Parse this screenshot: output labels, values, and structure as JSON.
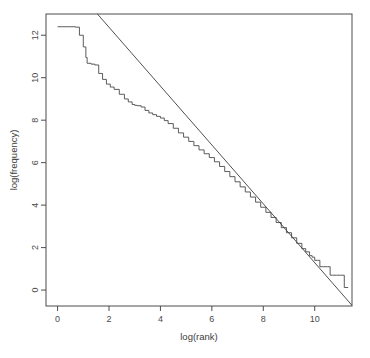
{
  "figure": {
    "background_color": "#ffffff",
    "frame_color": "#4d4d4d",
    "data_color": "#4a4a4a",
    "fit_color": "#3c3c3c",
    "plot_box": {
      "left": 46,
      "top": 14,
      "right": 352,
      "bottom": 306
    }
  },
  "chart_data": {
    "type": "line",
    "title": "",
    "subtitle": "",
    "xlabel": "log(rank)",
    "ylabel": "log(frequency)",
    "xlim": [
      -0.45,
      11.45
    ],
    "ylim": [
      -0.75,
      13.0
    ],
    "xticks": [
      0,
      2,
      4,
      6,
      8,
      10
    ],
    "yticks": [
      0,
      2,
      4,
      6,
      8,
      10,
      12
    ],
    "xtick_labels": [
      "0",
      "2",
      "4",
      "6",
      "8",
      "10"
    ],
    "ytick_labels": [
      "0",
      "2",
      "4",
      "6",
      "8",
      "10",
      "12"
    ],
    "grid": false,
    "legend": null,
    "legend_position": "none",
    "series": [
      {
        "name": "empirical",
        "style": "step",
        "description": "observed log frequency versus log rank (Zipf curve)",
        "x": [
          0.0,
          0.2,
          0.4,
          0.6,
          0.69,
          0.85,
          1.0,
          1.1,
          1.15,
          1.3,
          1.45,
          1.6,
          1.75,
          1.9,
          2.05,
          2.2,
          2.4,
          2.6,
          2.75,
          2.9,
          3.0,
          3.1,
          3.25,
          3.4,
          3.55,
          3.7,
          3.85,
          4.0,
          4.15,
          4.3,
          4.5,
          4.7,
          4.9,
          5.1,
          5.3,
          5.5,
          5.7,
          5.9,
          6.1,
          6.3,
          6.5,
          6.7,
          6.9,
          7.1,
          7.3,
          7.5,
          7.7,
          7.9,
          8.1,
          8.3,
          8.5,
          8.7,
          8.9,
          9.1,
          9.3,
          9.5,
          9.65,
          9.8,
          9.9,
          10.0,
          10.1,
          10.2,
          10.35,
          10.5,
          10.6,
          10.7,
          10.85,
          11.0,
          11.15,
          11.3
        ],
        "y": [
          12.4,
          12.4,
          12.4,
          12.4,
          12.38,
          12.0,
          11.45,
          10.95,
          10.68,
          10.64,
          10.6,
          10.2,
          9.92,
          9.7,
          9.56,
          9.45,
          9.22,
          9.0,
          8.86,
          8.74,
          8.7,
          8.68,
          8.62,
          8.46,
          8.34,
          8.26,
          8.18,
          8.1,
          7.98,
          7.84,
          7.62,
          7.4,
          7.2,
          7.0,
          6.8,
          6.6,
          6.42,
          6.24,
          6.04,
          5.82,
          5.58,
          5.34,
          5.1,
          4.86,
          4.62,
          4.38,
          4.14,
          3.9,
          3.66,
          3.42,
          3.18,
          2.94,
          2.7,
          2.46,
          2.2,
          1.95,
          1.8,
          1.62,
          1.55,
          1.4,
          1.4,
          1.1,
          1.1,
          1.1,
          0.7,
          0.7,
          0.7,
          0.7,
          0.12,
          0.12
        ]
      },
      {
        "name": "fitted-line",
        "style": "line",
        "description": "least-squares Zipf fit, straight line on log-log axes",
        "endpoints": {
          "x": [
            1.55,
            11.45
          ],
          "y": [
            13.0,
            -0.72
          ]
        },
        "slope": -1.386,
        "intercept": 15.15
      }
    ],
    "annotations": []
  },
  "axis_titles": {
    "x": "log(rank)",
    "y": "log(frequency)"
  }
}
